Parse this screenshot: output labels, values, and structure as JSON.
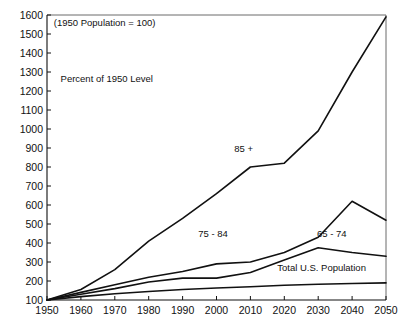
{
  "chart_data": {
    "type": "line",
    "title": "",
    "subtitle": "",
    "xlabel": "",
    "ylabel": "",
    "annotations": [
      {
        "text": "(1950 Population = 100)",
        "x": 1952,
        "y": 1540
      },
      {
        "text": "Percent of 1950 Level",
        "x": 1954,
        "y": 1245
      }
    ],
    "x": [
      1950,
      1960,
      1970,
      1980,
      1990,
      2000,
      2010,
      2020,
      2030,
      2040,
      2050
    ],
    "xlim": [
      1950,
      2050
    ],
    "ylim": [
      100,
      1600
    ],
    "xticks": [
      1950,
      1960,
      1970,
      1980,
      1990,
      2000,
      2010,
      2020,
      2030,
      2040,
      2050
    ],
    "yticks": [
      100,
      200,
      300,
      400,
      500,
      600,
      700,
      800,
      900,
      1000,
      1100,
      1200,
      1300,
      1400,
      1500,
      1600
    ],
    "grid": false,
    "legend": "inline-labels",
    "series": [
      {
        "name": "85 +",
        "label_x": 2008,
        "label_y": 880,
        "values": [
          100,
          155,
          260,
          410,
          530,
          660,
          800,
          820,
          990,
          1300,
          1590
        ]
      },
      {
        "name": "75 - 84",
        "label_x": 1999,
        "label_y": 430,
        "values": [
          100,
          140,
          180,
          220,
          250,
          290,
          300,
          350,
          430,
          620,
          520
        ]
      },
      {
        "name": "65 - 74",
        "label_x": 2034,
        "label_y": 430,
        "values": [
          100,
          130,
          160,
          195,
          215,
          215,
          245,
          310,
          375,
          350,
          330
        ]
      },
      {
        "name": "Total U.S. Population",
        "label_x": 2031,
        "label_y": 255,
        "values": [
          100,
          118,
          133,
          145,
          155,
          163,
          170,
          178,
          183,
          187,
          190
        ]
      }
    ]
  },
  "axis": {
    "y_tick_labels": [
      "1600",
      "1500",
      "1400",
      "1300",
      "1200",
      "1100",
      "1000",
      "900",
      "800",
      "700",
      "600",
      "500",
      "400",
      "300",
      "200",
      "100"
    ],
    "x_tick_labels": [
      "1950",
      "1960",
      "1970",
      "1980",
      "1990",
      "2000",
      "2010",
      "2020",
      "2030",
      "2040",
      "2050"
    ]
  },
  "colors": {
    "line": "#111111",
    "axis": "#111111",
    "frame": "#5a5a5a",
    "background": "#ffffff"
  }
}
